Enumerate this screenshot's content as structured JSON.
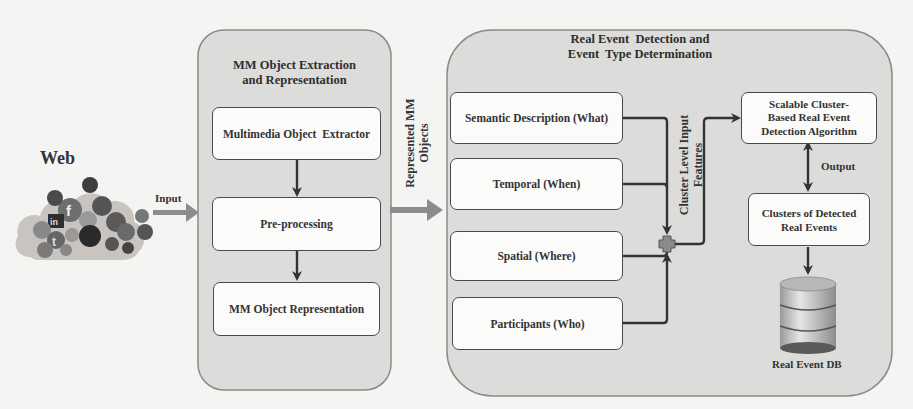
{
  "diagram": {
    "web": {
      "label": "Web",
      "icon": "social-media-cloud-icon",
      "input_arrow_label": "Input"
    },
    "extraction_panel": {
      "title_line1": "MM Object Extraction",
      "title_line2": "and Representation",
      "steps": [
        {
          "label": "Multimedia Object  Extractor"
        },
        {
          "label": "Pre-processing"
        },
        {
          "label": "MM Object Representation"
        }
      ]
    },
    "connector": {
      "label_line1": "Represented MM",
      "label_line2": "Objects"
    },
    "detection_panel": {
      "title_line1": "Real Event  Detection and",
      "title_line2": "Event  Type Determination",
      "features": [
        {
          "label": "Semantic Description (What)"
        },
        {
          "label": "Temporal (When)"
        },
        {
          "label": "Spatial (Where)"
        },
        {
          "label": "Participants (Who)"
        }
      ],
      "merge_label_line1": "Cluster Level Input",
      "merge_label_line2": "Features",
      "algorithm": {
        "line1": "Scalable Cluster-",
        "line2": "Based Real Event",
        "line3": "Detection Algorithm"
      },
      "output_label": "Output",
      "clusters": {
        "line1": "Clusters of Detected",
        "line2": "Real Events"
      },
      "database": {
        "label": "Real Event DB",
        "icon": "database-icon"
      }
    },
    "colors": {
      "panel_fill": "#dcdcda",
      "box_fill": "#fbfbfa",
      "arrow_dark": "#3a3a3a",
      "arrow_gray": "#8c8c8c",
      "junction": "#8a8a8a"
    }
  }
}
